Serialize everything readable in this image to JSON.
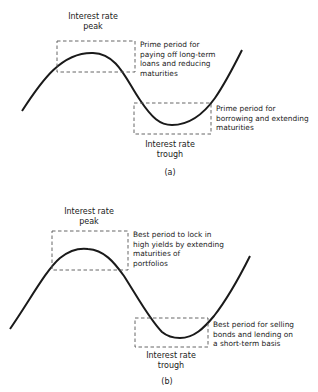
{
  "panels": [
    {
      "id": "a",
      "caption": "(a)",
      "peak_label": [
        "Interest rate",
        "peak"
      ],
      "trough_label": [
        "Interest rate",
        "trough"
      ],
      "peak_note": [
        "Prime period for",
        "paying off long-term",
        "loans and reducing",
        "maturities"
      ],
      "trough_note": [
        "Prime period for",
        "borrowing and extending",
        "maturities"
      ]
    },
    {
      "id": "b",
      "caption": "(b)",
      "peak_label": [
        "Interest rate",
        "peak"
      ],
      "trough_label": [
        "Interest rate",
        "trough"
      ],
      "peak_note": [
        "Best period to lock in",
        "high yields by extending",
        "maturities of",
        "portfolios"
      ],
      "trough_note": [
        "Best period for selling",
        "bonds and lending on",
        "a short-term basis"
      ]
    }
  ],
  "colors": {
    "line": "#1a1a1a",
    "dashed_box": "#555555",
    "background": "#ffffff"
  }
}
